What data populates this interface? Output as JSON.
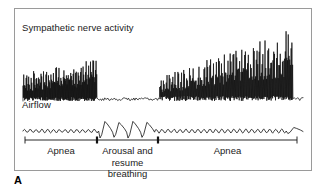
{
  "figure": {
    "panel_letter": "A",
    "border_color": "#9a9a9a",
    "trace_color": "#111111",
    "background": "#ffffff"
  },
  "signals": [
    {
      "id": "sna",
      "label": "Sympathetic nerve activity",
      "description": "Bursting neurogram, high amplitude during apnea, suppressed during arousal and resume breathing, progressively increasing amplitude during second apnea"
    },
    {
      "id": "airflow",
      "label": "Airflow",
      "description": "Flat during apnea with small ripples, four large breath oscillations during arousal and resume breathing"
    }
  ],
  "axis": {
    "segments": [
      {
        "label": "Apnea"
      },
      {
        "label": "Arousal and\nresume breathing"
      },
      {
        "label": "Apnea"
      }
    ],
    "tick_positions": [
      25,
      97,
      158,
      297
    ],
    "baseline_y": 140
  },
  "chart_data": {
    "type": "line",
    "title": "",
    "xlabel": "",
    "ylabel": "",
    "grid": false,
    "legend_position": "none",
    "x_range": [
      0,
      1
    ],
    "series": [
      {
        "name": "Sympathetic nerve activity",
        "baseline_y": 92,
        "segments": [
          {
            "phase": "Apnea",
            "x_start": 0.0,
            "x_end": 0.265,
            "burst_count": 30,
            "amplitude_start": 26,
            "amplitude_end": 40,
            "noise": 4
          },
          {
            "phase": "Arousal and resume breathing",
            "x_start": 0.265,
            "x_end": 0.488,
            "burst_count": 0,
            "amplitude_start": 3,
            "amplitude_end": 3,
            "noise": 2
          },
          {
            "phase": "Apnea",
            "x_start": 0.488,
            "x_end": 0.965,
            "burst_count": 46,
            "amplitude_start": 22,
            "amplitude_end": 66,
            "noise": 5
          },
          {
            "phase": "Apnea end",
            "x_start": 0.965,
            "x_end": 1.0,
            "burst_count": 0,
            "amplitude_start": 3,
            "amplitude_end": 3,
            "noise": 2
          }
        ]
      },
      {
        "name": "Airflow",
        "baseline_y": 122,
        "segments": [
          {
            "phase": "Apnea",
            "x_start": 0.0,
            "x_end": 0.27,
            "wave": "ripple",
            "amplitude": 2.0,
            "cycles": 13
          },
          {
            "phase": "Arousal and resume breathing",
            "x_start": 0.27,
            "x_end": 0.47,
            "wave": "breath",
            "amplitude": 13.0,
            "cycles": 4
          },
          {
            "phase": "Apnea",
            "x_start": 0.47,
            "x_end": 0.94,
            "wave": "ripple",
            "amplitude": 2.2,
            "cycles": 22
          },
          {
            "phase": "Apnea end",
            "x_start": 0.94,
            "x_end": 1.0,
            "wave": "breath",
            "amplitude": 5.0,
            "cycles": 1
          }
        ]
      }
    ]
  }
}
